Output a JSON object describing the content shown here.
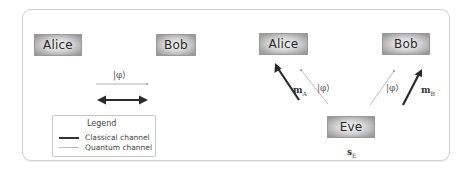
{
  "diagram": {
    "left_scenario": {
      "nodes": [
        {
          "id": "alice",
          "label": "Alice"
        },
        {
          "id": "bob",
          "label": "Bob"
        }
      ],
      "quantum_state_label": "|φ⟩",
      "channels": [
        {
          "type": "quantum",
          "from": "alice",
          "to": "bob",
          "label": "|φ⟩",
          "direction": "one-way"
        },
        {
          "type": "classical",
          "between": [
            "alice",
            "bob"
          ],
          "direction": "two-way"
        }
      ]
    },
    "right_scenario": {
      "nodes": [
        {
          "id": "alice",
          "label": "Alice"
        },
        {
          "id": "bob",
          "label": "Bob"
        },
        {
          "id": "eve",
          "label": "Eve"
        }
      ],
      "labels": {
        "alice_quantum": "|φ⟩",
        "bob_quantum": "|φ⟩",
        "alice_classical": "m",
        "alice_classical_sub": "A",
        "bob_classical": "m",
        "bob_classical_sub": "B",
        "eve_state": "s",
        "eve_state_sub": "E"
      },
      "channels": [
        {
          "type": "quantum",
          "from": "eve",
          "to": "alice",
          "label": "|φ⟩"
        },
        {
          "type": "classical",
          "from": "eve",
          "to": "alice",
          "label": "m_A"
        },
        {
          "type": "quantum",
          "from": "eve",
          "to": "bob",
          "label": "|φ⟩"
        },
        {
          "type": "classical",
          "from": "eve",
          "to": "bob",
          "label": "m_B"
        }
      ]
    },
    "legend": {
      "title": "Legend",
      "items": [
        {
          "type": "classical",
          "label": "Classical channel"
        },
        {
          "type": "quantum",
          "label": "Quantum channel"
        }
      ]
    }
  }
}
